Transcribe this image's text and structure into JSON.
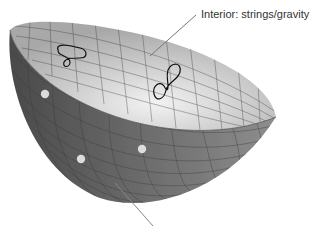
{
  "labels": {
    "interior": "Interior: strings/gravity"
  },
  "figure": {
    "shape": "hemispherical-bowl",
    "boundary_points": 3,
    "interior_loops": 2,
    "colors": {
      "outer_surface": "#6e6e6e",
      "inner_surface": "#d6d6d6",
      "grid": "#3a3a3a",
      "points": "#dcdcdc",
      "loops": "#111111",
      "leader": "#777777"
    }
  }
}
